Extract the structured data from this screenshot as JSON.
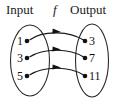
{
  "diagram": {
    "type": "function-mapping-diagram",
    "headers": {
      "input_label": "Input",
      "function_label": "f",
      "output_label": "Output"
    },
    "input_set": {
      "name": "Input",
      "items": [
        {
          "value": "1",
          "cx": 27,
          "cy": 41
        },
        {
          "value": "3",
          "cx": 27,
          "cy": 58
        },
        {
          "value": "5",
          "cx": 27,
          "cy": 76
        }
      ],
      "oval": {
        "cx": 30,
        "cy": 60.5,
        "rx": 19.5,
        "ry": 35.5
      }
    },
    "output_set": {
      "name": "Output",
      "items": [
        {
          "value": "3",
          "cx": 85,
          "cy": 41
        },
        {
          "value": "7",
          "cx": 85,
          "cy": 58
        },
        {
          "value": "11",
          "cx": 85,
          "cy": 76
        }
      ],
      "oval": {
        "cx": 92,
        "cy": 60.5,
        "rx": 16.5,
        "ry": 36.5
      }
    },
    "mappings": [
      {
        "from": "1",
        "to": "3",
        "path": "M 29.5 40 C 44 29.5, 70 31.5, 83.5 40",
        "arrow_x": 57,
        "arrow_y": 31.6,
        "arrow_rot": 5
      },
      {
        "from": "3",
        "to": "7",
        "path": "M 29.5 57 C 44 47.5, 70 48.5, 83.5 57",
        "arrow_x": 57,
        "arrow_y": 49.3,
        "arrow_rot": 4
      },
      {
        "from": "5",
        "to": "11",
        "path": "M 29.5 75 C 44 65.5, 70 66.5, 83.5 75",
        "arrow_x": 57,
        "arrow_y": 67.3,
        "arrow_rot": 4
      }
    ],
    "colors": {
      "stroke": "#2b2b2b",
      "text": "#111111",
      "background": "#ffffff"
    }
  }
}
